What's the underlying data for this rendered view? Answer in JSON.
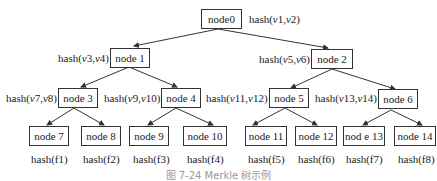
{
  "diagram": {
    "type": "merkle-tree",
    "nodes": [
      {
        "id": "node0",
        "label": "node0",
        "hash_label": "hash(v1,v2)"
      },
      {
        "id": "node1",
        "label": "node 1",
        "hash_label": "hash(v3,v4)"
      },
      {
        "id": "node2",
        "label": "node 2",
        "hash_label": "hash(v5,v6)"
      },
      {
        "id": "node3",
        "label": "node 3",
        "hash_label": "hash(v7,v8)"
      },
      {
        "id": "node4",
        "label": "node 4",
        "hash_label": "hash(v9,v10)"
      },
      {
        "id": "node5",
        "label": "node 5",
        "hash_label": "hash(v11,v12)"
      },
      {
        "id": "node6",
        "label": "node 6",
        "hash_label": "hash(v13,v14)"
      },
      {
        "id": "node7",
        "label": "node 7",
        "hash_label": "hash(f1)"
      },
      {
        "id": "node8",
        "label": "node 8",
        "hash_label": "hash(f2)"
      },
      {
        "id": "node9",
        "label": "node 9",
        "hash_label": "hash(f3)"
      },
      {
        "id": "node10",
        "label": "node 10",
        "hash_label": "hash(f4)"
      },
      {
        "id": "node11",
        "label": "node 11",
        "hash_label": "hash(f5)"
      },
      {
        "id": "node12",
        "label": "node 12",
        "hash_label": "hash(f6)"
      },
      {
        "id": "node13",
        "label": "nod e 13",
        "hash_label": "hash(f7)"
      },
      {
        "id": "node14",
        "label": "node 14",
        "hash_label": "hash(f8)"
      }
    ],
    "edges": [
      [
        "node0",
        "node1"
      ],
      [
        "node0",
        "node2"
      ],
      [
        "node1",
        "node3"
      ],
      [
        "node1",
        "node4"
      ],
      [
        "node2",
        "node5"
      ],
      [
        "node2",
        "node6"
      ],
      [
        "node3",
        "node7"
      ],
      [
        "node3",
        "node8"
      ],
      [
        "node4",
        "node9"
      ],
      [
        "node4",
        "node10"
      ],
      [
        "node5",
        "node11"
      ],
      [
        "node5",
        "node12"
      ],
      [
        "node6",
        "node13"
      ],
      [
        "node6",
        "node14"
      ]
    ],
    "caption": "图 7-24 Merkle 树示例"
  }
}
